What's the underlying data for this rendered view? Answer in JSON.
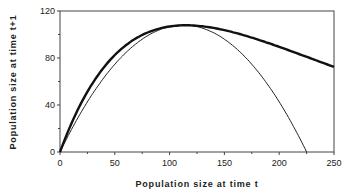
{
  "chart_data": {
    "type": "line",
    "title": "",
    "xlabel": "Population size at time t",
    "ylabel": "Population size at time t+1",
    "xlim": [
      0,
      250
    ],
    "ylim": [
      0,
      120
    ],
    "xticks": [
      0,
      50,
      100,
      150,
      200,
      250
    ],
    "yticks": [
      0,
      40,
      80,
      120
    ],
    "grid": false,
    "legend": "none",
    "series": [
      {
        "name": "thick curve (Ricker-type)",
        "x": [
          0,
          25,
          50,
          75,
          100,
          115,
          125,
          150,
          175,
          200,
          225,
          250
        ],
        "values": [
          0,
          51,
          83,
          100,
          107,
          108,
          107,
          104,
          97,
          89,
          81,
          73
        ]
      },
      {
        "name": "thin curve (parabola)",
        "x": [
          0,
          25,
          50,
          75,
          100,
          112.5,
          125,
          150,
          175,
          200,
          225
        ],
        "values": [
          0,
          43,
          75,
          96,
          107,
          108,
          107,
          96,
          75,
          43,
          0
        ]
      }
    ]
  }
}
